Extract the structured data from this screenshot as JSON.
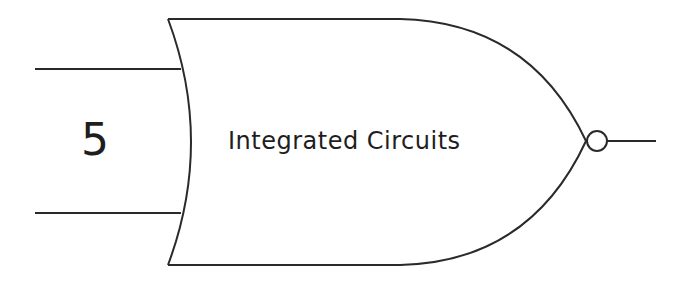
{
  "diagram": {
    "type": "NOR gate symbol (chapter heading)",
    "chapter_number": "5",
    "chapter_title": "Integrated Circuits",
    "stroke_color": "#2a2a2a",
    "background_color": "#ffffff"
  }
}
